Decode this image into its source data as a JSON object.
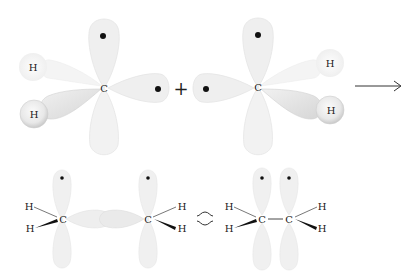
{
  "diagram": {
    "type": "orbital-overlap",
    "top_row": {
      "left_fragment": {
        "center_atom": "C",
        "hydrogens": [
          "H",
          "H"
        ],
        "unpaired_electrons": 2
      },
      "operator": "+",
      "right_fragment": {
        "center_atom": "C",
        "hydrogens": [
          "H",
          "H"
        ],
        "unpaired_electrons": 2
      },
      "arrow": "→"
    },
    "bottom_row": {
      "orbital_picture": {
        "atoms": [
          "C",
          "C"
        ],
        "hydrogens": [
          "H",
          "H",
          "H",
          "H"
        ],
        "unpaired_electrons": 2
      },
      "equivalence_symbol": "≎",
      "bond_line_picture": {
        "atoms": [
          "C",
          "C"
        ],
        "bond": "—",
        "hydrogens": [
          "H",
          "H",
          "H",
          "H"
        ],
        "unpaired_electrons": 2
      }
    },
    "colors": {
      "lobe_fill": "#efefef",
      "lobe_stroke": "#e2e2e2",
      "stipple_fill": "#dcdcdc",
      "text": "#222222",
      "dot": "#111111"
    }
  }
}
